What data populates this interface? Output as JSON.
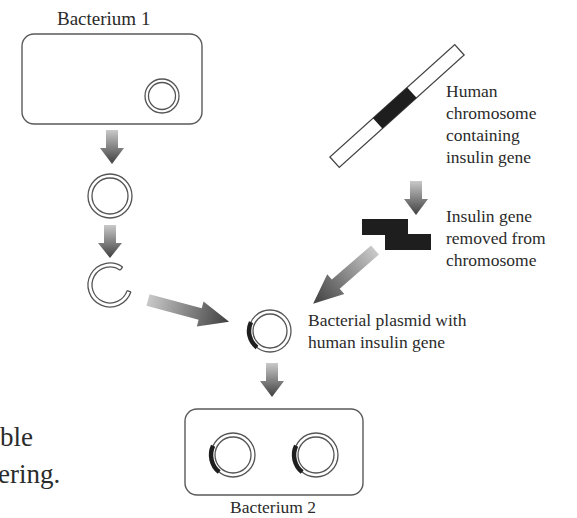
{
  "diagram": {
    "title_fragments": {
      "line1": "ble",
      "line2": "ering."
    },
    "bacterium1": {
      "label": "Bacterium 1"
    },
    "chromosome": {
      "label_lines": [
        "Human",
        "chromosome",
        "containing",
        "insulin gene"
      ]
    },
    "gene_removed": {
      "label_lines": [
        "Insulin gene",
        "removed from",
        "chromosome"
      ]
    },
    "recombinant_plasmid": {
      "label_lines": [
        "Bacterial plasmid with",
        "human insulin gene"
      ]
    },
    "bacterium2": {
      "label": "Bacterium 2"
    },
    "colors": {
      "outline": "#555555",
      "gene": "#1e1e1e",
      "arrow_light": "#c8c8c8",
      "arrow_dark": "#4a4a4a"
    }
  }
}
